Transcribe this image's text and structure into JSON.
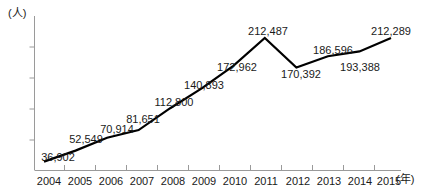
{
  "chart_data": {
    "type": "line",
    "title": "",
    "subtitle": "",
    "xlabel": "(年)",
    "ylabel": "(人)",
    "grid": false,
    "legend": "none",
    "categories": [
      "2004",
      "2005",
      "2006",
      "2007",
      "2008",
      "2009",
      "2010",
      "2011",
      "2012",
      "2013",
      "2014",
      "2015"
    ],
    "values": [
      36902,
      52549,
      70914,
      81651,
      112800,
      140893,
      172962,
      212487,
      170392,
      186596,
      193388,
      212289
    ],
    "value_labels": [
      "36,902",
      "52,549",
      "70,914",
      "81,651",
      "112,800",
      "140,893",
      "172,962",
      "212,487",
      "170,392",
      "186,596",
      "193,388",
      "212,289"
    ],
    "xlim": [
      2004,
      2015
    ],
    "ylim": [
      0,
      230000
    ],
    "series_color": "#000000"
  },
  "axis": {
    "y_unit": "(人)",
    "x_unit": "(年)",
    "x_tick_labels": [
      "2004",
      "2005",
      "2006",
      "2007",
      "2008",
      "2009",
      "2010",
      "2011",
      "2012",
      "2013",
      "2014",
      "2015"
    ]
  },
  "labels": {
    "p0": "36,902",
    "p1": "52,549",
    "p2": "70,914",
    "p3": "81,651",
    "p4": "112,800",
    "p5": "140,893",
    "p6": "172,962",
    "p7": "212,487",
    "p8": "170,392",
    "p9": "186,596",
    "p10": "193,388",
    "p11": "212,289"
  },
  "colors": {
    "line": "#000000",
    "axis": "#9a9a9a",
    "text": "#1a1a1a",
    "background": "#ffffff"
  }
}
